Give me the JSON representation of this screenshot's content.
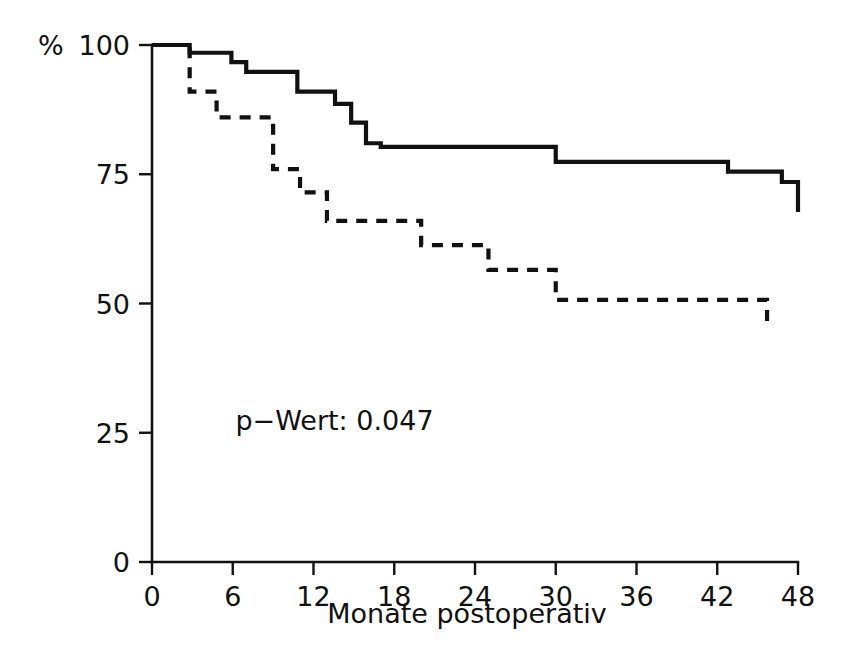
{
  "chart_data": {
    "type": "line",
    "title": "",
    "subtitle": "",
    "xlabel": "Monate postoperativ",
    "ylabel": "%",
    "xlim": [
      0,
      48
    ],
    "ylim": [
      0,
      100
    ],
    "grid": false,
    "legend": "none",
    "xticks": [
      "0",
      "6",
      "12",
      "18",
      "24",
      "30",
      "36",
      "42",
      "48"
    ],
    "xtick_values": [
      0,
      6,
      12,
      18,
      24,
      30,
      36,
      42,
      48
    ],
    "yticks": [
      "0",
      "25",
      "50",
      "75",
      "100"
    ],
    "ytick_values": [
      0,
      25,
      50,
      75,
      100
    ],
    "annotations": [
      {
        "name": "p-value",
        "text": "p−Wert: 0.047",
        "x": 6.2,
        "y": 25.5
      }
    ],
    "series": [
      {
        "name": "solid-curve",
        "style": "solid",
        "x": [
          0,
          2.8,
          2.8,
          5.9,
          5.9,
          7.0,
          7.0,
          10.8,
          10.8,
          13.6,
          13.6,
          14.8,
          14.8,
          15.9,
          15.9,
          17.0,
          17.0,
          30.0,
          30.0,
          42.8,
          42.8,
          46.8,
          46.8,
          48.0,
          48.0
        ],
        "y": [
          100,
          100,
          98.5,
          98.5,
          96.7,
          96.7,
          94.8,
          94.8,
          91.0,
          91.0,
          88.6,
          88.6,
          85.0,
          85.0,
          81.0,
          81.0,
          80.3,
          80.3,
          77.4,
          77.4,
          75.5,
          75.5,
          73.5,
          73.5,
          67.7
        ],
        "step_points": [
          {
            "month": 0,
            "percent": 100
          },
          {
            "month": 2.8,
            "percent": 98.5
          },
          {
            "month": 5.9,
            "percent": 96.7
          },
          {
            "month": 7.0,
            "percent": 94.8
          },
          {
            "month": 10.8,
            "percent": 91.0
          },
          {
            "month": 13.6,
            "percent": 88.6
          },
          {
            "month": 14.8,
            "percent": 85.0
          },
          {
            "month": 15.9,
            "percent": 81.0
          },
          {
            "month": 17.0,
            "percent": 80.3
          },
          {
            "month": 30.0,
            "percent": 77.4
          },
          {
            "month": 42.8,
            "percent": 75.5
          },
          {
            "month": 46.8,
            "percent": 73.5
          },
          {
            "month": 48.0,
            "percent": 67.7
          }
        ]
      },
      {
        "name": "dashed-curve",
        "style": "dashed",
        "x": [
          0,
          2.8,
          2.8,
          4.8,
          4.8,
          9.0,
          9.0,
          11.0,
          11.0,
          13.0,
          13.0,
          20.0,
          20.0,
          25.0,
          25.0,
          30.0,
          30.0,
          45.7,
          45.7
        ],
        "y": [
          100,
          100,
          91.0,
          91.0,
          86.0,
          86.0,
          76.0,
          76.0,
          71.5,
          71.5,
          66.0,
          66.0,
          61.3,
          61.3,
          56.5,
          56.5,
          50.7,
          50.7,
          45.0
        ],
        "step_points": [
          {
            "month": 0,
            "percent": 100
          },
          {
            "month": 2.8,
            "percent": 91.0
          },
          {
            "month": 4.8,
            "percent": 86.0
          },
          {
            "month": 9.0,
            "percent": 76.0
          },
          {
            "month": 11.0,
            "percent": 71.5
          },
          {
            "month": 13.0,
            "percent": 66.0
          },
          {
            "month": 20.0,
            "percent": 61.3
          },
          {
            "month": 25.0,
            "percent": 56.5
          },
          {
            "month": 30.0,
            "percent": 50.7
          },
          {
            "month": 45.7,
            "percent": 45.0
          }
        ]
      }
    ]
  },
  "colors": {
    "ink": "#111111",
    "background": "#ffffff"
  }
}
